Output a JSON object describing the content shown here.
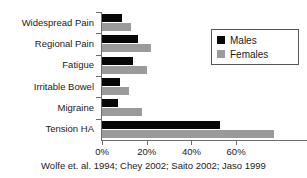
{
  "chart_data": {
    "type": "bar",
    "orientation": "horizontal",
    "title": "",
    "xlabel": "",
    "ylabel": "",
    "xlim": [
      0,
      78
    ],
    "grid": false,
    "legend_position": "top-right",
    "categories": [
      "Widespread Pain",
      "Regional Pain",
      "Fatigue",
      "Irritable Bowel",
      "Migraine",
      "Tension HA"
    ],
    "series": [
      {
        "name": "Males",
        "color": "#070707",
        "values": [
          9,
          16,
          14,
          8,
          7,
          53
        ]
      },
      {
        "name": "Females",
        "color": "#9a9a9a",
        "values": [
          13,
          22,
          20,
          12,
          18,
          77
        ]
      }
    ],
    "xticks": [
      0,
      20,
      40,
      60
    ],
    "xtick_labels": [
      "0%",
      "20%",
      "40%",
      "60%"
    ],
    "caption": "Wolfe et. al. 1994; Chey 2002; Saito 2002; Jaso 1999"
  },
  "legend": {
    "items": [
      {
        "label": "Males"
      },
      {
        "label": "Females"
      }
    ]
  }
}
